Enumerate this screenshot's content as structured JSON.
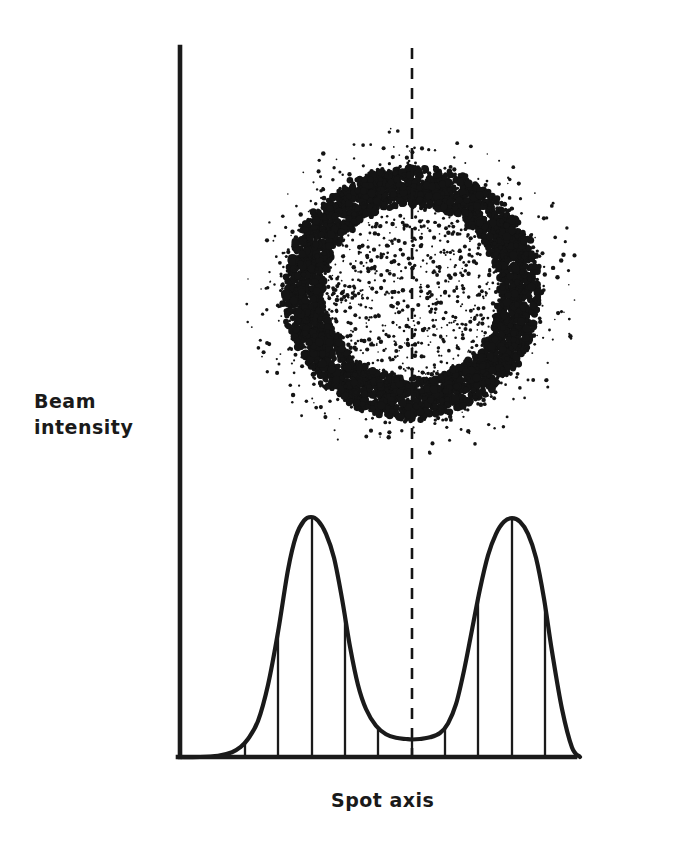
{
  "figure": {
    "name": "beam-intensity-spot-profile",
    "background_color": "#ffffff",
    "ink_color": "#1a1a1a"
  },
  "axes": {
    "y_label": "Beam\nintensity",
    "x_label": "Spot axis",
    "origin_x": 180,
    "origin_y": 757,
    "y_axis_top": 47,
    "x_axis_right": 530
  },
  "speckle_spot": {
    "name": "laser-spot-speckle-pattern",
    "center_x": 412,
    "center_y": 292,
    "ring_radius": 108,
    "ring_thickness": 26,
    "halo_outer_radius": 168,
    "interior_density": 0.34,
    "ring_density": 1.0,
    "halo_density": 0.2,
    "dot_count": 9000
  },
  "centerline": {
    "name": "spot-axis-dashed-centerline",
    "x": 412,
    "y_top": 48,
    "y_bottom": 757,
    "dash": "11 9",
    "width": 2.6
  },
  "ordinates": {
    "name": "intensity-ordinate-lines",
    "x_positions": [
      245,
      278,
      312,
      345,
      378,
      412,
      445,
      478,
      512,
      545
    ]
  },
  "chart_data": {
    "type": "line",
    "title": "",
    "xlabel": "Spot axis",
    "ylabel": "Beam intensity",
    "xlim": [
      180,
      580
    ],
    "ylim": [
      0,
      1
    ],
    "grid": false,
    "legend": null,
    "series": [
      {
        "name": "beam intensity profile",
        "x": [
          180,
          200,
          218,
          232,
          240,
          248,
          258,
          268,
          278,
          288,
          296,
          304,
          311,
          318,
          326,
          334,
          342,
          350,
          358,
          366,
          376,
          386,
          396,
          406,
          412,
          420,
          430,
          440,
          448,
          456,
          464,
          472,
          480,
          488,
          496,
          504,
          512,
          520,
          528,
          536,
          544,
          552,
          562,
          572,
          580
        ],
        "y": [
          0.0,
          0.0,
          0.005,
          0.02,
          0.04,
          0.075,
          0.15,
          0.3,
          0.52,
          0.78,
          0.92,
          0.985,
          1.0,
          0.985,
          0.93,
          0.83,
          0.66,
          0.46,
          0.3,
          0.2,
          0.13,
          0.095,
          0.08,
          0.075,
          0.073,
          0.075,
          0.082,
          0.1,
          0.14,
          0.22,
          0.36,
          0.53,
          0.7,
          0.84,
          0.93,
          0.98,
          0.995,
          0.98,
          0.93,
          0.83,
          0.66,
          0.44,
          0.2,
          0.04,
          0.0
        ]
      }
    ],
    "peaks": [
      {
        "label": "left lobe peak",
        "x": 311,
        "y": 1.0
      },
      {
        "label": "right lobe peak",
        "x": 512,
        "y": 0.995
      }
    ],
    "valley": {
      "label": "central minimum",
      "x": 412,
      "y": 0.073
    },
    "ordinate_x_values": [
      245,
      278,
      312,
      345,
      378,
      412,
      445,
      478,
      512,
      545
    ]
  }
}
